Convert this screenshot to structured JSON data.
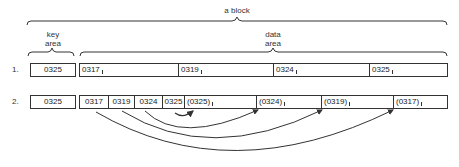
{
  "labels": {
    "block": "a block",
    "key_area_line1": "key",
    "key_area_line2": "area",
    "data_area_line1": "data",
    "data_area_line2": "area"
  },
  "rows": [
    {
      "label": "1.",
      "key": "0325",
      "data_cells": [
        "0317",
        "0319",
        "0324",
        "0325"
      ]
    },
    {
      "label": "2.",
      "key": "0325",
      "key_cells": [
        "0317",
        "0319",
        "0324",
        "0325"
      ],
      "data_cells": [
        "(0325)",
        "(0324)",
        "(0319)",
        "(0317)"
      ]
    }
  ],
  "arrows": [
    {
      "from": "0325",
      "to": "(0325)"
    },
    {
      "from": "0324",
      "to": "(0324)"
    },
    {
      "from": "0319",
      "to": "(0319)"
    },
    {
      "from": "0317",
      "to": "(0317)"
    }
  ],
  "colors": {
    "line": "#333333",
    "background": "#ffffff"
  }
}
